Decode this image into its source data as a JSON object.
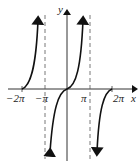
{
  "figure": {
    "axes": {
      "x_label": "x",
      "y_label": "y",
      "x_ticks": [
        "−2π",
        "−π",
        "π",
        "2π"
      ]
    },
    "asymptotes": [
      "x = −π",
      "x = π"
    ],
    "colors": {
      "curve": "#111111",
      "axis": "#333333",
      "asymptote": "#555555"
    }
  }
}
